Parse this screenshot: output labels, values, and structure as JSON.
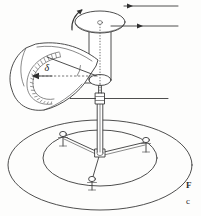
{
  "figure": {
    "type": "engineering-line-drawing",
    "background_color": "#fdfdfc",
    "line_color": "#3a3a3a"
  },
  "labels": {
    "angle_symbol": "δ"
  },
  "caption": {
    "line_1": "F",
    "line_2": "c"
  },
  "components": {
    "drum": "rotating-cylinder",
    "rotation_arrow": "counterclockwise-rotation-arrow",
    "leader_arrow_upper": "leader-arrow-right",
    "leader_arrow_lower": "leader-arrow-right",
    "scale": "curved-graduated-protractor-scale",
    "pointer": "scale-pointer-arrow-left",
    "reference_line": "horizontal-dashed-reference-line",
    "shaft": "vertical-shaft",
    "collar": "shaft-collar-joint",
    "base": "tripod-base-on-circular-plate",
    "feet_count": 3
  }
}
